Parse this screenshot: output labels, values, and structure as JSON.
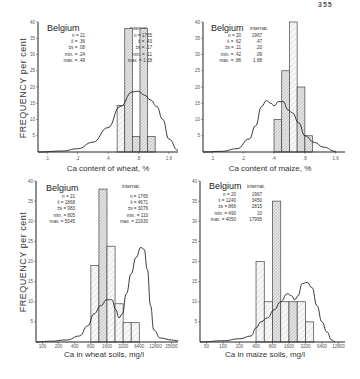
{
  "page_number": "355",
  "chart_data": [
    {
      "type": "bar",
      "id": "wheat-ca",
      "title": "",
      "xlabel": "Ca content of wheat, %",
      "ylabel": "FREQUENCY per cent",
      "ylim": [
        0,
        40
      ],
      "yticks": [
        "5",
        "10",
        "15",
        "20",
        "25",
        "30",
        "35",
        "40"
      ],
      "xticks": [
        ".1",
        ".2",
        ".4",
        ".8",
        "1.6"
      ],
      "x_scale": "log2",
      "xlim_idx": [
        -0.3,
        4.3
      ],
      "bars": [
        {
          "from": 2.3,
          "to": 2.55,
          "value": 14.3,
          "hatch": "light"
        },
        {
          "from": 2.55,
          "to": 2.8,
          "value": 38,
          "hatch": "dense"
        },
        {
          "from": 2.8,
          "to": 3.05,
          "value": 4.8,
          "hatch": "dense"
        },
        {
          "from": 3.05,
          "to": 3.3,
          "value": 38,
          "hatch": "dense"
        },
        {
          "from": 3.3,
          "to": 3.55,
          "value": 4.8,
          "hatch": "dense"
        }
      ],
      "curve": [
        [
          -0.3,
          0
        ],
        [
          0.5,
          0.3
        ],
        [
          1.0,
          1.0
        ],
        [
          1.5,
          3
        ],
        [
          2.0,
          7.5
        ],
        [
          2.4,
          14
        ],
        [
          2.8,
          18.5
        ],
        [
          3.0,
          18.7
        ],
        [
          3.2,
          17.5
        ],
        [
          3.4,
          16
        ],
        [
          3.6,
          14
        ],
        [
          3.8,
          10
        ],
        [
          4.0,
          4
        ],
        [
          4.3,
          0.5
        ]
      ],
      "legend": {
        "region": "Belgium",
        "intl_header": "internat.",
        "stat_names": [
          "n",
          "x̄",
          "±s",
          "min.",
          "max."
        ],
        "belgium": [
          "21",
          ".36",
          ".08",
          ".24",
          ".49"
        ],
        "internat": [
          "1765",
          ".43",
          ".17",
          ".11",
          "1.68"
        ]
      }
    },
    {
      "type": "bar",
      "id": "maize-ca",
      "title": "",
      "xlabel": "Ca content of maize, %",
      "ylabel": "",
      "ylim": [
        0,
        40
      ],
      "yticks": [
        "5",
        "10",
        "15",
        "20",
        "25",
        "30",
        "35",
        "40"
      ],
      "xticks": [
        ".1",
        ".2",
        ".4",
        ".8",
        "1.6"
      ],
      "x_scale": "log2",
      "xlim_idx": [
        -0.3,
        4.3
      ],
      "bars": [
        {
          "from": 2.0,
          "to": 2.25,
          "value": 10,
          "hatch": "dense"
        },
        {
          "from": 2.25,
          "to": 2.5,
          "value": 25,
          "hatch": "dense"
        },
        {
          "from": 2.5,
          "to": 2.75,
          "value": 40,
          "hatch": "light"
        },
        {
          "from": 2.75,
          "to": 3.0,
          "value": 20,
          "hatch": "dense"
        },
        {
          "from": 3.0,
          "to": 3.25,
          "value": 5,
          "hatch": "dense"
        }
      ],
      "curve": [
        [
          -0.3,
          0
        ],
        [
          0.3,
          0.2
        ],
        [
          0.8,
          1
        ],
        [
          1.2,
          4
        ],
        [
          1.4,
          8
        ],
        [
          1.6,
          14
        ],
        [
          1.75,
          15.8
        ],
        [
          1.9,
          15
        ],
        [
          2.0,
          14.2
        ],
        [
          2.15,
          15.5
        ],
        [
          2.3,
          15.5
        ],
        [
          2.45,
          13
        ],
        [
          2.6,
          12
        ],
        [
          2.8,
          9
        ],
        [
          3.0,
          5
        ],
        [
          3.3,
          3
        ],
        [
          3.6,
          1.5
        ],
        [
          4.0,
          0.2
        ]
      ],
      "legend": {
        "region": "Belgium",
        "intl_header": "internat.",
        "stat_names": [
          "n",
          "x̄",
          "±s",
          "min.",
          "max."
        ],
        "belgium": [
          "20",
          ".62",
          ".11",
          ".42",
          ".86"
        ],
        "internat": [
          "1967",
          ".47",
          ".20",
          ".09",
          "1.88"
        ]
      }
    },
    {
      "type": "bar",
      "id": "wheat-soil-ca",
      "title": "",
      "xlabel": "Ca in wheat soils, mg/l",
      "ylabel": "FREQUENCY per cent",
      "ylim": [
        0,
        40
      ],
      "yticks": [
        "5",
        "10",
        "15",
        "20",
        "25",
        "30",
        "35",
        "40"
      ],
      "xticks": [
        "100",
        "200",
        "400",
        "800",
        "1600",
        "3200",
        "6400",
        "12800",
        "25600"
      ],
      "x_scale": "log2",
      "xlim_idx": [
        -0.4,
        8.4
      ],
      "bars": [
        {
          "from": 3.0,
          "to": 3.5,
          "value": 19,
          "hatch": "light"
        },
        {
          "from": 3.5,
          "to": 4.0,
          "value": 38,
          "hatch": "dense"
        },
        {
          "from": 4.0,
          "to": 4.5,
          "value": 23.8,
          "hatch": "light"
        },
        {
          "from": 4.5,
          "to": 5.0,
          "value": 9.5,
          "hatch": "light"
        },
        {
          "from": 5.0,
          "to": 5.5,
          "value": 4.8,
          "hatch": "light"
        },
        {
          "from": 5.5,
          "to": 6.0,
          "value": 4.8,
          "hatch": "light"
        }
      ],
      "curve": [
        [
          -0.4,
          0
        ],
        [
          0.5,
          0.2
        ],
        [
          1.5,
          0.5
        ],
        [
          2.3,
          1.5
        ],
        [
          2.8,
          4
        ],
        [
          3.2,
          7
        ],
        [
          3.6,
          9
        ],
        [
          4.0,
          10.5
        ],
        [
          4.3,
          10.5
        ],
        [
          4.55,
          8
        ],
        [
          4.75,
          6
        ],
        [
          4.95,
          7
        ],
        [
          5.2,
          12
        ],
        [
          5.5,
          17
        ],
        [
          5.8,
          21
        ],
        [
          6.1,
          23.5
        ],
        [
          6.3,
          23
        ],
        [
          6.5,
          18
        ],
        [
          6.7,
          9
        ],
        [
          6.9,
          3
        ],
        [
          7.3,
          1
        ],
        [
          8.0,
          0.5
        ],
        [
          8.4,
          0.3
        ]
      ],
      "legend": {
        "region": "Belgium",
        "intl_header": "internat.",
        "stat_names": [
          "n",
          "x̄",
          "±s",
          "min.",
          "max."
        ],
        "belgium": [
          "21",
          "1868",
          "983",
          "805",
          "5045"
        ],
        "internat": [
          "1765",
          "4671",
          "3076",
          "110",
          "21930"
        ]
      }
    },
    {
      "type": "bar",
      "id": "maize-soil-ca",
      "title": "",
      "xlabel": "Ca in maize soils, mg/l",
      "ylabel": "",
      "ylim": [
        0,
        40
      ],
      "yticks": [
        "5",
        "10",
        "15",
        "20",
        "25",
        "30",
        "35",
        "40"
      ],
      "xticks": [
        "50",
        "100",
        "200",
        "400",
        "800",
        "1600",
        "3200",
        "6400",
        "12800"
      ],
      "x_scale": "log2",
      "xlim_idx": [
        -0.4,
        8.4
      ],
      "bars": [
        {
          "from": 3.0,
          "to": 3.5,
          "value": 20,
          "hatch": "light"
        },
        {
          "from": 3.5,
          "to": 4.0,
          "value": 10,
          "hatch": "light"
        },
        {
          "from": 4.0,
          "to": 4.5,
          "value": 35,
          "hatch": "dense"
        },
        {
          "from": 4.5,
          "to": 5.0,
          "value": 10,
          "hatch": "light"
        },
        {
          "from": 5.0,
          "to": 5.5,
          "value": 10,
          "hatch": "dense"
        },
        {
          "from": 5.5,
          "to": 6.0,
          "value": 10,
          "hatch": "light"
        },
        {
          "from": 6.0,
          "to": 6.5,
          "value": 5,
          "hatch": "light"
        }
      ],
      "curve": [
        [
          -0.4,
          0
        ],
        [
          1.0,
          0.3
        ],
        [
          2.0,
          0.8
        ],
        [
          2.7,
          1.5
        ],
        [
          3.0,
          3.5
        ],
        [
          3.3,
          5
        ],
        [
          3.7,
          6
        ],
        [
          4.1,
          8
        ],
        [
          4.5,
          10
        ],
        [
          4.9,
          12
        ],
        [
          5.15,
          11.5
        ],
        [
          5.35,
          10.5
        ],
        [
          5.55,
          11.5
        ],
        [
          5.8,
          14.5
        ],
        [
          6.1,
          14.8
        ],
        [
          6.4,
          13.5
        ],
        [
          6.7,
          9
        ],
        [
          7.0,
          5
        ],
        [
          7.3,
          2.5
        ],
        [
          7.6,
          0.5
        ],
        [
          7.8,
          0
        ]
      ],
      "legend": {
        "region": "Belgium",
        "intl_header": "internat.",
        "stat_names": [
          "n",
          "x̄",
          "±s",
          "min.",
          "max."
        ],
        "belgium": [
          "20",
          "1240",
          "866",
          "490",
          "4050"
        ],
        "internat": [
          "1967",
          "3450",
          "2815",
          "10",
          "17995"
        ]
      }
    }
  ]
}
